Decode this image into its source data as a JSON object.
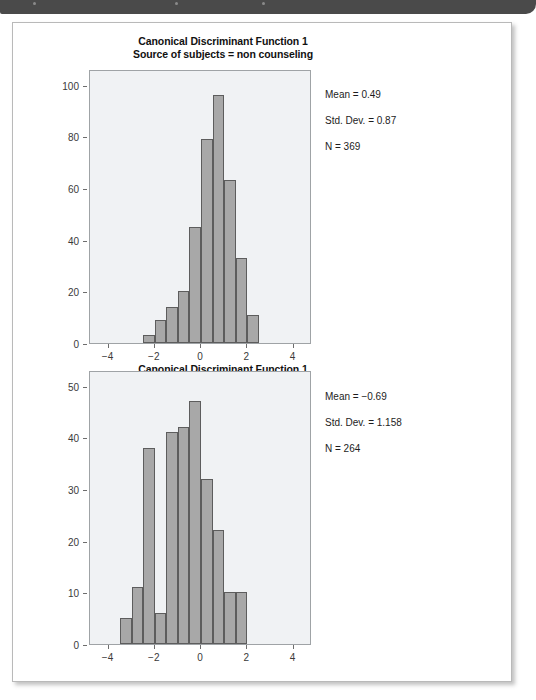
{
  "page": {
    "top_bar": {
      "name": "page-header-bar"
    }
  },
  "figure": {
    "panels": [
      {
        "id": "non-counseling",
        "title_line1": "Canonical Discriminant Function 1",
        "title_line2": "Source of subjects = non counseling",
        "annotation": {
          "mean": "Mean = 0.49",
          "std_dev": "Std. Dev. = 0.87",
          "n": "N = 369"
        }
      },
      {
        "id": "counseling",
        "title_line1": "Canonical Discriminant Function 1",
        "title_line2": "Source of subjects = counseling",
        "annotation": {
          "mean": "Mean = −0.69",
          "std_dev": "Std. Dev. = 1.158",
          "n": "N = 264"
        }
      }
    ]
  },
  "colors": {
    "bar_fill": "#a8a8a8",
    "bar_stroke": "#5d5d5d",
    "plot_bg": "#f0f2f4",
    "axis": "#6d6d6d",
    "header_bar": "#4a4a4a"
  },
  "chart_data": [
    {
      "type": "bar",
      "title": "Canonical Discriminant Function 1 — Source of subjects = non counseling",
      "xlabel": "",
      "ylabel": "",
      "xlim": [
        -4.8,
        4.8
      ],
      "ylim": [
        0,
        106
      ],
      "xticks": [
        -4,
        -2,
        0,
        2,
        4
      ],
      "yticks": [
        0,
        20,
        40,
        60,
        80,
        100
      ],
      "grid": false,
      "legend": false,
      "bin_width": 0.5,
      "bin_centers": [
        -2.25,
        -1.75,
        -1.25,
        -0.75,
        -0.25,
        0.25,
        0.75,
        1.25,
        1.75,
        2.25
      ],
      "categories": [
        "-2.25",
        "-1.75",
        "-1.25",
        "-0.75",
        "-0.25",
        "0.25",
        "0.75",
        "1.25",
        "1.75",
        "2.25"
      ],
      "values": [
        3,
        9,
        14,
        20,
        45,
        79,
        96,
        63,
        33,
        11
      ],
      "annotations": [
        "Mean = 0.49",
        "Std. Dev. = 0.87",
        "N = 369"
      ]
    },
    {
      "type": "bar",
      "title": "Canonical Discriminant Function 1 — Source of subjects = counseling",
      "xlabel": "",
      "ylabel": "",
      "xlim": [
        -4.8,
        4.8
      ],
      "ylim": [
        0,
        53
      ],
      "xticks": [
        -4,
        -2,
        0,
        2,
        4
      ],
      "yticks": [
        0,
        10,
        20,
        30,
        40,
        50
      ],
      "grid": false,
      "legend": false,
      "bin_width": 0.5,
      "bin_centers": [
        -3.25,
        -2.75,
        -2.25,
        -1.75,
        -1.25,
        -0.75,
        -0.25,
        0.25,
        0.75,
        1.25,
        1.75
      ],
      "categories": [
        "-3.25",
        "-2.75",
        "-2.25",
        "-1.75",
        "-1.25",
        "-0.75",
        "-0.25",
        "0.25",
        "0.75",
        "1.25",
        "1.75"
      ],
      "values": [
        5,
        11,
        38,
        6,
        41,
        42,
        47,
        32,
        22,
        10,
        10
      ],
      "annotations": [
        "Mean = −0.69",
        "Std. Dev. = 1.158",
        "N = 264"
      ]
    }
  ]
}
